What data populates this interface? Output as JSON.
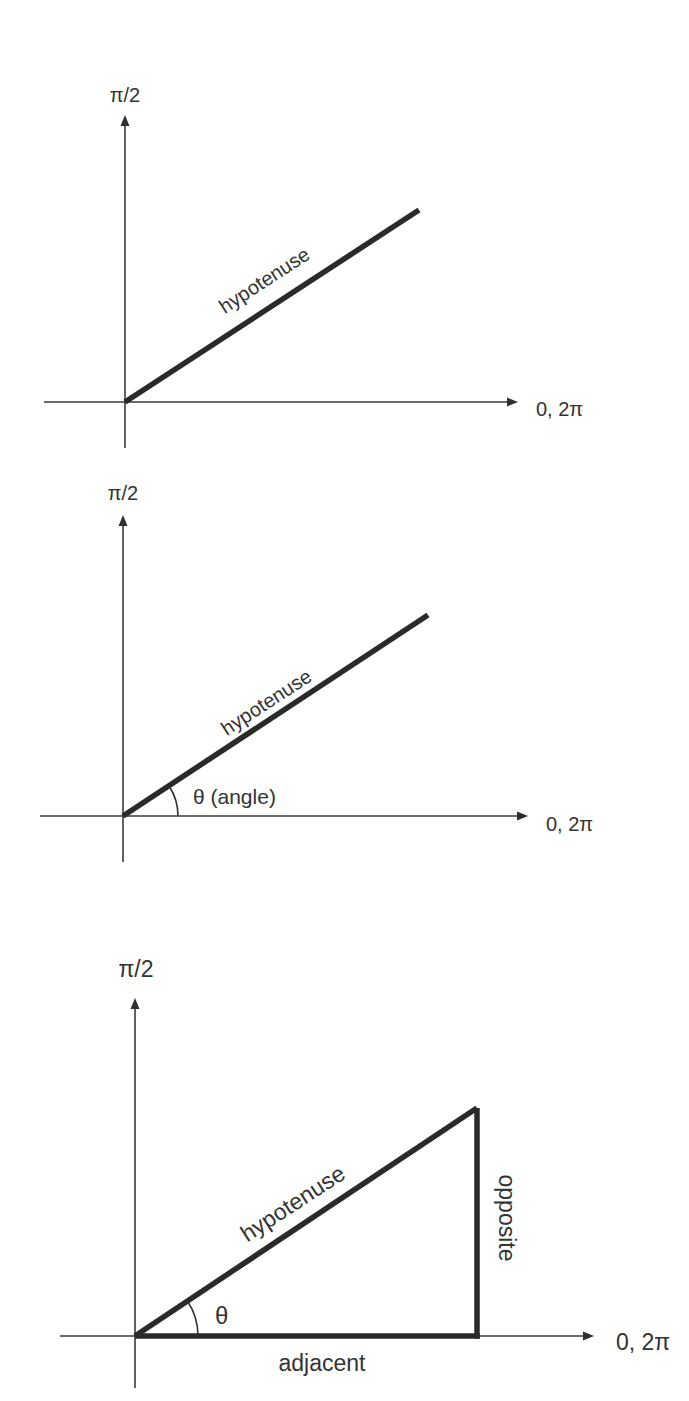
{
  "colors": {
    "background": "#ffffff",
    "line": "#2a2a2a",
    "text": "#333333"
  },
  "diagrams": [
    {
      "id": "diagram-1",
      "origin": [
        125,
        402
      ],
      "y_axis": {
        "top": 117,
        "bottom": 448,
        "label": "π/2",
        "label_pos": [
          125,
          102
        ]
      },
      "x_axis": {
        "left": 44,
        "right": 517,
        "label": "0, 2π",
        "label_pos": [
          536,
          416
        ]
      },
      "hypotenuse": {
        "end": [
          419,
          210
        ],
        "label": "hypotenuse",
        "label_pos": [
          268,
          286
        ],
        "angle_deg": -33
      }
    },
    {
      "id": "diagram-2",
      "origin": [
        123,
        816
      ],
      "y_axis": {
        "top": 517,
        "bottom": 862,
        "label": "π/2",
        "label_pos": [
          122,
          500
        ]
      },
      "x_axis": {
        "left": 40,
        "right": 527,
        "label": "0, 2π",
        "label_pos": [
          546,
          831
        ]
      },
      "hypotenuse": {
        "end": [
          428,
          615
        ],
        "label": "hypotenuse",
        "label_pos": [
          270,
          713
        ],
        "angle_deg": -33
      },
      "angle": {
        "arc_radius": 55,
        "label": "θ (angle)",
        "label_pos": [
          193,
          804
        ]
      }
    },
    {
      "id": "diagram-3",
      "origin": [
        135,
        1336
      ],
      "y_axis": {
        "top": 1000,
        "bottom": 1388,
        "label": "π/2",
        "label_pos": [
          136,
          977
        ]
      },
      "x_axis": {
        "left": 60,
        "right": 593,
        "label": "0, 2π",
        "label_pos": [
          616,
          1350
        ]
      },
      "hypotenuse": {
        "end": [
          477,
          1108
        ],
        "label": "hypotenuse",
        "label_pos": [
          297,
          1210
        ],
        "angle_deg": -33
      },
      "angle": {
        "arc_radius": 63,
        "label": "θ",
        "label_pos": [
          215,
          1324
        ]
      },
      "opposite": {
        "label": "opposite",
        "label_pos": [
          499,
          1218
        ]
      },
      "adjacent": {
        "label": "adjacent",
        "label_pos": [
          322,
          1372
        ]
      }
    }
  ]
}
